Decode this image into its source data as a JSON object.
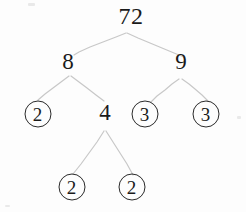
{
  "diagram": {
    "type": "factor-tree",
    "background_color": "#fdfdfd",
    "line_color": "#c8c8c8",
    "circle_stroke_color": "#2a2a2a",
    "text_color": "#1a1a1a",
    "nodes": [
      {
        "id": "root",
        "label": "72",
        "circled": false,
        "x": 131,
        "y": 16
      },
      {
        "id": "n8",
        "label": "8",
        "circled": false,
        "x": 68,
        "y": 61
      },
      {
        "id": "n9",
        "label": "9",
        "circled": false,
        "x": 181,
        "y": 61
      },
      {
        "id": "n2a",
        "label": "2",
        "circled": true,
        "x": 37.5,
        "y": 114
      },
      {
        "id": "n4",
        "label": "4",
        "circled": false,
        "x": 105,
        "y": 112
      },
      {
        "id": "n3a",
        "label": "3",
        "circled": true,
        "x": 144.5,
        "y": 114
      },
      {
        "id": "n3b",
        "label": "3",
        "circled": true,
        "x": 205.5,
        "y": 114
      },
      {
        "id": "n2b",
        "label": "2",
        "circled": true,
        "x": 71.5,
        "y": 187
      },
      {
        "id": "n2c",
        "label": "2",
        "circled": true,
        "x": 131.5,
        "y": 187
      }
    ],
    "edges": [
      {
        "from": "root",
        "to": "n8",
        "points": "126,33 116,37 103,42 90,47 79,52 74,55"
      },
      {
        "from": "root",
        "to": "n9",
        "points": "127,33 138,38 150,43 162,48 174,53 184,57"
      },
      {
        "from": "n8",
        "to": "n2a",
        "points": "69,76 61,82 53,88 45,94 38,100"
      },
      {
        "from": "n8",
        "to": "n4",
        "points": "71,76 79,82 87,88 96,95 104,101"
      },
      {
        "from": "n9",
        "to": "n3a",
        "points": "179,79 172,84 165,90 157,96 151,102"
      },
      {
        "from": "n9",
        "to": "n3b",
        "points": "182,79 189,84 195,89 202,95 208,101"
      },
      {
        "from": "n4",
        "to": "n2b",
        "points": "104,131 97,142 89,153 81,164 73,174"
      },
      {
        "from": "n4",
        "to": "n2c",
        "points": "106,131 113,142 120,153 127,164 133,175"
      }
    ],
    "factorization": {
      "number": 72,
      "factors_level_1": [
        8,
        9
      ],
      "factors_level_2": [
        2,
        4,
        3,
        3
      ],
      "factors_level_3": [
        2,
        2
      ],
      "primes": [
        2,
        2,
        2,
        3,
        3
      ]
    }
  }
}
